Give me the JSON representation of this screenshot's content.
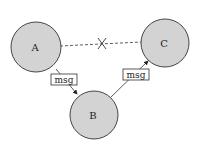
{
  "diagram": {
    "nodes": [
      {
        "id": "A",
        "label": "A",
        "cx": 36,
        "cy": 47,
        "r": 25
      },
      {
        "id": "B",
        "label": "B",
        "cx": 94,
        "cy": 115,
        "r": 24
      },
      {
        "id": "C",
        "label": "C",
        "cx": 165,
        "cy": 43,
        "r": 24
      }
    ],
    "edges": [
      {
        "from": "A",
        "to": "B",
        "label": "msg",
        "style": "solid"
      },
      {
        "from": "B",
        "to": "C",
        "label": "msg",
        "style": "solid"
      },
      {
        "from": "A",
        "to": "C",
        "style": "dashed",
        "blocked": true,
        "marker": "x-mark"
      }
    ],
    "colors": {
      "node_fill": "#d3d3d3",
      "stroke": "#333333"
    }
  }
}
